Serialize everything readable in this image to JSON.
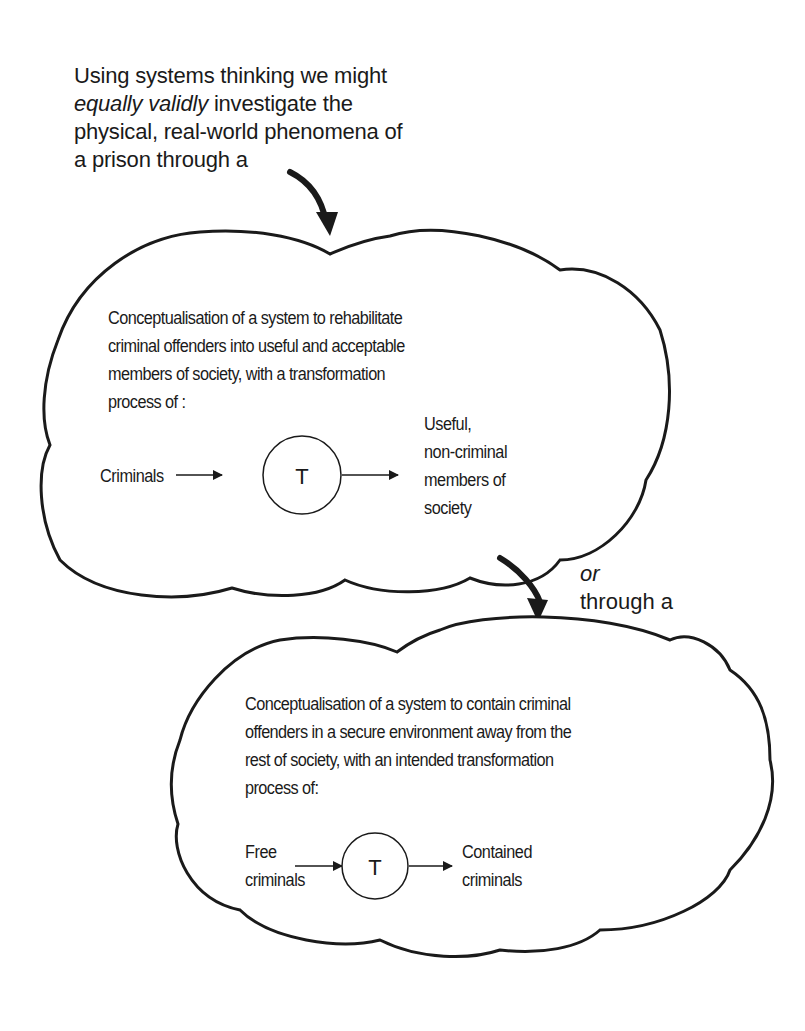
{
  "intro": {
    "line1": "Using systems thinking we might",
    "line2_italic": "equally validly",
    "line2_rest": " investigate the",
    "line3": "physical, real-world phenomena of",
    "line4": "a prison through a"
  },
  "cloud1": {
    "description": [
      "Conceptualisation of a system to rehabilitate",
      "criminal offenders into useful and acceptable",
      "members of society, with a transformation",
      "process of :"
    ],
    "input": "Criminals",
    "transform": "T",
    "output": [
      "Useful,",
      "non-criminal",
      "members of",
      "society"
    ]
  },
  "connector": {
    "or": "or",
    "through": "through a"
  },
  "cloud2": {
    "description": [
      "Conceptualisation of a system to contain criminal",
      "offenders in a secure environment away from the",
      "rest of society, with an intended transformation",
      "process of:"
    ],
    "input": [
      "Free",
      "criminals"
    ],
    "transform": "T",
    "output": [
      "Contained",
      "criminals"
    ]
  },
  "colors": {
    "ink": "#1a1a1a",
    "background": "#ffffff"
  }
}
